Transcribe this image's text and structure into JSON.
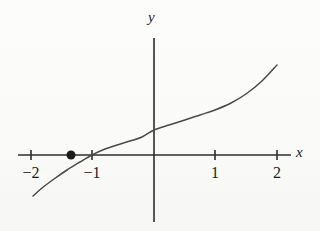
{
  "figure": {
    "background_color": "#fdfdfc",
    "ink_color": "#3a3a3a",
    "width": 320,
    "height": 231
  },
  "axes": {
    "x_axis_label": "x",
    "y_axis_label": "y",
    "x_axis_pixel_y": 155,
    "y_axis_pixel_x": 154,
    "x_axis_pixel_start": 18,
    "x_axis_pixel_end": 291,
    "y_axis_pixel_top": 38,
    "y_axis_pixel_bottom": 222,
    "pixels_per_unit_x": 61.5,
    "tick_half_length": 5
  },
  "chart_data": {
    "type": "line",
    "title": "",
    "xlabel": "x",
    "ylabel": "y",
    "grid": false,
    "legend": null,
    "xlim": [
      -2.2,
      2.3
    ],
    "ylim": [
      -1.9,
      1.6
    ],
    "x_ticks": [
      {
        "value": -2,
        "label": "−2",
        "pixel_x": 31
      },
      {
        "value": -1,
        "label": "−1",
        "pixel_x": 92
      },
      {
        "value": 1,
        "label": "1",
        "pixel_x": 215
      },
      {
        "value": 2,
        "label": "2",
        "pixel_x": 277
      }
    ],
    "y_ticks": [],
    "series": [
      {
        "name": "curve",
        "type": "line",
        "color": "#4a4a4a",
        "x": [
          -1.95,
          -1.8,
          -1.6,
          -1.4,
          -1.2,
          -1.0,
          -0.8,
          -0.6,
          -0.4,
          -0.2,
          0.0,
          0.25,
          0.5,
          0.75,
          1.0,
          1.25,
          1.5,
          1.75,
          2.0
        ],
        "y": [
          -0.67,
          -0.54,
          -0.39,
          -0.25,
          -0.12,
          0.0,
          0.09,
          0.16,
          0.23,
          0.3,
          0.41,
          0.48,
          0.56,
          0.64,
          0.73,
          0.84,
          0.99,
          1.2,
          1.47
        ],
        "pixel_points": [
          [
            33,
            196
          ],
          [
            42,
            188
          ],
          [
            54,
            179
          ],
          [
            67,
            170
          ],
          [
            80,
            162
          ],
          [
            92,
            155
          ],
          [
            105,
            149
          ],
          [
            117,
            145
          ],
          [
            130,
            141
          ],
          [
            142,
            137
          ],
          [
            154,
            130
          ],
          [
            169,
            125
          ],
          [
            185,
            120
          ],
          [
            200,
            115
          ],
          [
            215,
            110
          ],
          [
            231,
            103
          ],
          [
            246,
            94
          ],
          [
            262,
            81
          ],
          [
            277,
            65
          ]
        ]
      }
    ],
    "markers": [
      {
        "name": "x-intercept-point",
        "label": "",
        "x": -1.0,
        "y": 0.0,
        "pixel_x": 71,
        "pixel_y": 155,
        "radius": 4.5,
        "filled": true,
        "color": "#1c1c1c"
      }
    ],
    "annotations": []
  }
}
